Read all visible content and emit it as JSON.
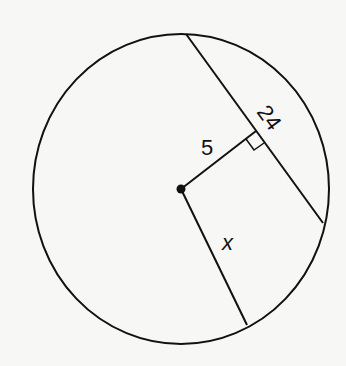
{
  "diagram": {
    "type": "circle-chord-geometry",
    "labels": {
      "perpendicular_distance": "5",
      "chord_length": "24",
      "radius": "x"
    },
    "right_angle_marker": true,
    "colors": {
      "stroke": "#111111",
      "background": "#f7f7f5"
    }
  }
}
